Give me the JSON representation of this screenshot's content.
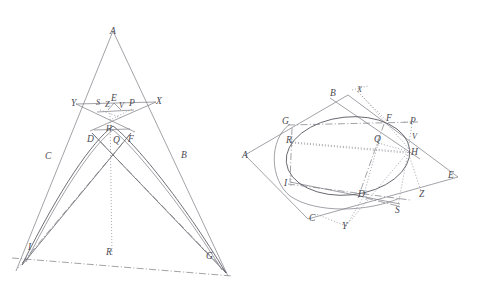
{
  "figure": {
    "background_color": "#ffffff",
    "stroke_color": "#7a7a82",
    "label_color": "#4a4a52",
    "line_styles": [
      "solid",
      "dash-dot",
      "dotted"
    ]
  },
  "left_figure": {
    "name": "triangle-with-inscribed-conic",
    "description": "Tall isosceles triangle with apex A, a parabola-like conic arc tangent inside, chords and dash-dot construction lines meeting a base line I-G.",
    "points": [
      {
        "label": "A",
        "x": 113,
        "y": 31,
        "lx": 110,
        "ly": 34
      },
      {
        "label": "Y",
        "x": 79,
        "y": 105,
        "lx": 71,
        "ly": 106
      },
      {
        "label": "S",
        "x": 100,
        "y": 108,
        "lx": 96,
        "ly": 105
      },
      {
        "label": "Z",
        "x": 108,
        "y": 108,
        "lx": 105,
        "ly": 107
      },
      {
        "label": "E",
        "x": 114,
        "y": 100,
        "lx": 111,
        "ly": 101
      },
      {
        "label": "V",
        "x": 122,
        "y": 108,
        "lx": 119,
        "ly": 108
      },
      {
        "label": "P",
        "x": 132,
        "y": 105,
        "lx": 129,
        "ly": 106
      },
      {
        "label": "X",
        "x": 152,
        "y": 103,
        "lx": 156,
        "ly": 104
      },
      {
        "label": "H",
        "x": 110,
        "y": 128,
        "lx": 106,
        "ly": 131
      },
      {
        "label": "D",
        "x": 92,
        "y": 133,
        "lx": 87,
        "ly": 142
      },
      {
        "label": "Q",
        "x": 116,
        "y": 133,
        "lx": 113,
        "ly": 143
      },
      {
        "label": "F",
        "x": 131,
        "y": 133,
        "lx": 128,
        "ly": 142
      },
      {
        "label": "C",
        "x": 57,
        "y": 152,
        "lx": 45,
        "ly": 159
      },
      {
        "label": "B",
        "x": 176,
        "y": 152,
        "lx": 181,
        "ly": 158
      },
      {
        "label": "I",
        "x": 31,
        "y": 250,
        "lx": 28,
        "ly": 250
      },
      {
        "label": "R",
        "x": 112,
        "y": 255,
        "lx": 106,
        "ly": 255
      },
      {
        "label": "G",
        "x": 214,
        "y": 264,
        "lx": 206,
        "ly": 259
      }
    ]
  },
  "right_figure": {
    "name": "quadrilateral-with-inscribed-ellipse",
    "description": "Convex quadrilateral A-B-E-C with an inscribed ellipse touching at G, F, D, I, plus dotted and dash-dot construction lines to exterior points X, P, V, Z, S, Y.",
    "points": [
      {
        "label": "B",
        "x": 338,
        "y": 98,
        "lx": 330,
        "ly": 96
      },
      {
        "label": "X",
        "x": 362,
        "y": 93,
        "lx": 357,
        "ly": 92
      },
      {
        "label": "G",
        "x": 290,
        "y": 124,
        "lx": 282,
        "ly": 124
      },
      {
        "label": "F",
        "x": 383,
        "y": 122,
        "lx": 386,
        "ly": 121
      },
      {
        "label": "P",
        "x": 412,
        "y": 125,
        "lx": 410,
        "ly": 124
      },
      {
        "label": "A",
        "x": 245,
        "y": 155,
        "lx": 242,
        "ly": 156
      },
      {
        "label": "R",
        "x": 293,
        "y": 140,
        "lx": 286,
        "ly": 141
      },
      {
        "label": "Q",
        "x": 378,
        "y": 142,
        "lx": 374,
        "ly": 142
      },
      {
        "label": "V",
        "x": 415,
        "y": 138,
        "lx": 412,
        "ly": 138
      },
      {
        "label": "H",
        "x": 408,
        "y": 151,
        "lx": 410,
        "ly": 153
      },
      {
        "label": "E",
        "x": 452,
        "y": 176,
        "lx": 448,
        "ly": 175
      },
      {
        "label": "I",
        "x": 290,
        "y": 182,
        "lx": 285,
        "ly": 183
      },
      {
        "label": "D",
        "x": 363,
        "y": 195,
        "lx": 359,
        "ly": 196
      },
      {
        "label": "Z",
        "x": 423,
        "y": 194,
        "lx": 419,
        "ly": 195
      },
      {
        "label": "S",
        "x": 399,
        "y": 209,
        "lx": 396,
        "ly": 211
      },
      {
        "label": "C",
        "x": 315,
        "y": 216,
        "lx": 310,
        "ly": 219
      },
      {
        "label": "Y",
        "x": 346,
        "y": 227,
        "lx": 343,
        "ly": 227
      }
    ]
  }
}
